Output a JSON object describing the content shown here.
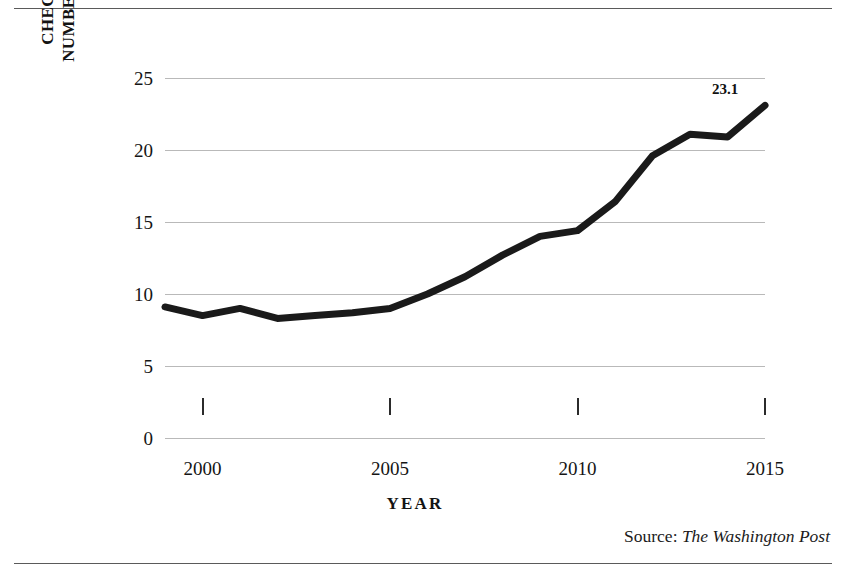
{
  "figure": {
    "background": "#ffffff",
    "line_color": "#1a1a1a",
    "grid_color": "#b9b9b9",
    "rule_color": "#5a5a5a"
  },
  "source": {
    "prefix": "Source:",
    "publication": "The Washington Post"
  },
  "chart_data": {
    "type": "line",
    "title": "",
    "xlabel": "YEAR",
    "ylabel": "NUMBER OF BACKGROUND CHECKS (IN MILLIONS)",
    "ylabel_lines": [
      "NUMBER OF BACKGROUND",
      "CHECKS (IN MILLIONS)"
    ],
    "x": [
      1999,
      2000,
      2001,
      2002,
      2003,
      2004,
      2005,
      2006,
      2007,
      2008,
      2009,
      2010,
      2011,
      2012,
      2013,
      2014,
      2015
    ],
    "values": [
      9.1,
      8.5,
      9.0,
      8.3,
      8.5,
      8.7,
      9.0,
      10.0,
      11.2,
      12.7,
      14.0,
      14.4,
      16.4,
      19.6,
      21.1,
      20.9,
      23.1
    ],
    "series": [
      {
        "name": "Number of background checks",
        "values": [
          9.1,
          8.5,
          9.0,
          8.3,
          8.5,
          8.7,
          9.0,
          10.0,
          11.2,
          12.7,
          14.0,
          14.4,
          16.4,
          19.6,
          21.1,
          20.9,
          23.1
        ]
      }
    ],
    "xlim": [
      1999,
      2015
    ],
    "ylim": [
      0,
      25
    ],
    "yticks": [
      0,
      5,
      10,
      15,
      20,
      25
    ],
    "ytick_labels": [
      "0",
      "5",
      "10",
      "15",
      "20",
      "25"
    ],
    "xticks": [
      2000,
      2005,
      2010,
      2015
    ],
    "xtick_labels": [
      "2000",
      "2005",
      "2010",
      "2015"
    ],
    "grid": "horizontal",
    "legend": "none",
    "annotations": [
      {
        "x": 2015,
        "y": 23.1,
        "text": "23.1",
        "bold": true
      }
    ]
  }
}
